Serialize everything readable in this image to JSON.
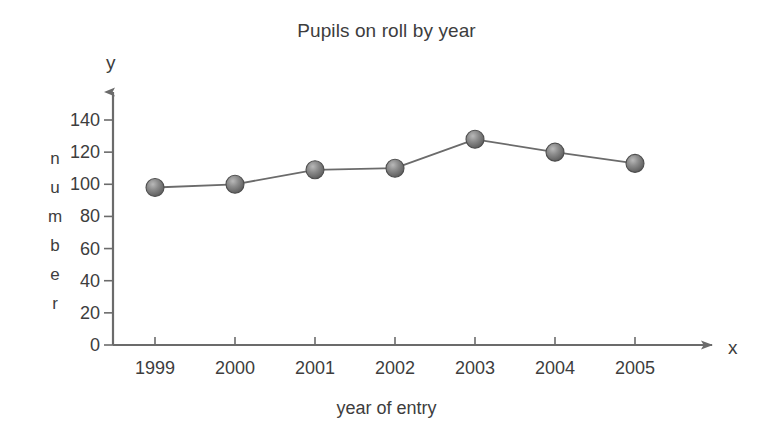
{
  "chart_data": {
    "type": "line",
    "title": "Pupils on roll by year",
    "xlabel": "year of entry",
    "ylabel": "number",
    "x_axis_letter": "x",
    "y_axis_letter": "y",
    "categories": [
      "1999",
      "2000",
      "2001",
      "2002",
      "2003",
      "2004",
      "2005"
    ],
    "values": [
      98,
      100,
      109,
      110,
      128,
      120,
      113
    ],
    "yticks": [
      0,
      20,
      40,
      60,
      80,
      100,
      120,
      140
    ],
    "ytick_labels": [
      "0",
      "20",
      "40",
      "60",
      "80",
      "100",
      "120",
      "140"
    ],
    "ylim": [
      0,
      150
    ],
    "grid": false,
    "legend": false,
    "series": [
      {
        "name": "Pupils on roll",
        "values": [
          98,
          100,
          109,
          110,
          128,
          120,
          113
        ]
      }
    ],
    "marker_style": "sphere",
    "marker_color": "#6f6f6f",
    "line_color": "#6b6b6b",
    "axis_color": "#6b6b6b",
    "text_color": "#3d3d3d"
  },
  "ylabel_letters": [
    "n",
    "u",
    "m",
    "b",
    "e",
    "r"
  ]
}
